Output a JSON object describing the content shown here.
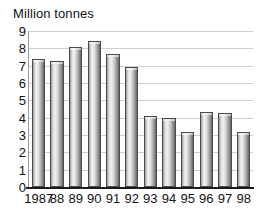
{
  "chart_data": {
    "type": "bar",
    "title": "Million tonnes",
    "xlabel": "",
    "ylabel": "Million tonnes",
    "ylim": [
      0,
      9
    ],
    "ytick_labels": [
      "9",
      "8",
      "7",
      "6",
      "5",
      "4",
      "3",
      "2",
      "1",
      "0"
    ],
    "grid": true,
    "legend": "none",
    "categories": [
      "1987",
      "88",
      "89",
      "90",
      "91",
      "92",
      "93",
      "94",
      "95",
      "96",
      "97",
      "98"
    ],
    "values": [
      7.4,
      7.25,
      8.05,
      8.4,
      7.65,
      6.95,
      4.1,
      4.0,
      3.2,
      4.35,
      4.25,
      3.2
    ]
  }
}
